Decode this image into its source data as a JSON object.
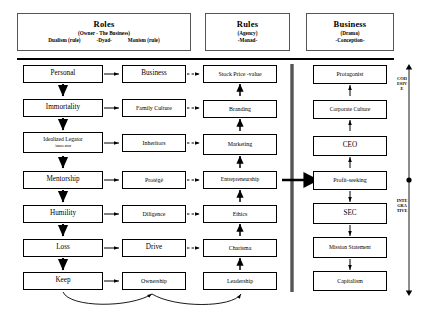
{
  "diagram": {
    "title_headers": [
      {
        "name": "roles",
        "title": "Roles",
        "subtitle": "(Owner - The Business)",
        "left_term": "Dualism (rule)",
        "center_term": "-Dyad-",
        "right_term": "Monism (rule)"
      },
      {
        "name": "rules",
        "title": "Rules",
        "subtitle": "(Agency)",
        "term": "-Monad-"
      },
      {
        "name": "business",
        "title": "Business",
        "subtitle": "(Drama)",
        "term": "-Conception-"
      }
    ],
    "columns": {
      "col1": {
        "name": "personal-column",
        "nodes": [
          "Personal",
          "Immortality",
          "Idealized Legator",
          "Mentorship",
          "Humility",
          "Loss",
          "Keep"
        ],
        "node3_line2": "/ancestor"
      },
      "col2": {
        "name": "business-column",
        "nodes": [
          "Business",
          "Family Culture",
          "Inheritors",
          "Protégé",
          "Diligence",
          "Drive",
          "Ownership"
        ]
      },
      "col3": {
        "name": "rules-column",
        "nodes": [
          "Stock Price -value",
          "Branding",
          "Marketing",
          "Entrepreneurship",
          "Ethics",
          "Charisma",
          "Leadership"
        ]
      },
      "col4": {
        "name": "drama-column",
        "nodes": [
          "Protagonist",
          "Corporate Culture",
          "CEO",
          "Profit-seeking",
          "SEC",
          "Mission Statement",
          "Capitalism"
        ]
      }
    },
    "side_labels": {
      "upper": "COHESIVE",
      "lower": "INTEGRATIVE"
    },
    "colors": {
      "stroke": "#000000",
      "header_stroke": "#555555",
      "background": "#ffffff"
    }
  }
}
